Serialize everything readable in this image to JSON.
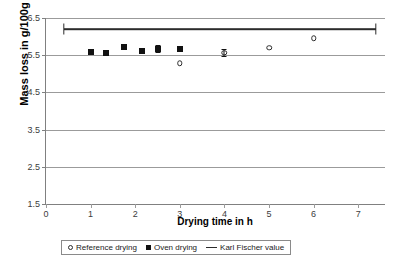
{
  "chart_data": {
    "type": "scatter",
    "title": "",
    "xlabel": "Drying time in h",
    "ylabel": "Mass loss in g/100g",
    "xlim": [
      0,
      7.6
    ],
    "ylim": [
      1.5,
      6.5
    ],
    "grid": true,
    "legend_position": "bottom",
    "x_ticks": [
      "0",
      "1",
      "2",
      "3",
      "4",
      "5",
      "6",
      "7"
    ],
    "x_tick_values": [
      0,
      1,
      2,
      3,
      4,
      5,
      6,
      7
    ],
    "y_ticks": [
      "1.5",
      "2.5",
      "3.5",
      "4.5",
      "5.5",
      "6.5"
    ],
    "y_tick_values": [
      1.5,
      2.5,
      3.5,
      4.5,
      5.5,
      6.5
    ],
    "series": [
      {
        "name": "Oven drying",
        "marker": "filled-square",
        "color": "#111111",
        "points": [
          {
            "x": 1.0,
            "y": 5.58,
            "yerr": 0.0
          },
          {
            "x": 1.35,
            "y": 5.55,
            "yerr": 0.0
          },
          {
            "x": 1.75,
            "y": 5.72,
            "yerr": 0.0
          },
          {
            "x": 2.15,
            "y": 5.6,
            "yerr": 0.0
          },
          {
            "x": 2.5,
            "y": 5.68,
            "yerr": 0.09
          },
          {
            "x": 3.0,
            "y": 5.68,
            "yerr": 0.0
          }
        ]
      },
      {
        "name": "Reference drying",
        "marker": "open-circle",
        "color": "#2b2b2b",
        "points": [
          {
            "x": 3.0,
            "y": 5.28,
            "yerr": 0.0
          },
          {
            "x": 4.0,
            "y": 5.57,
            "yerr": 0.1
          },
          {
            "x": 5.0,
            "y": 5.7,
            "yerr": 0.0
          },
          {
            "x": 6.0,
            "y": 5.95,
            "yerr": 0.0
          }
        ]
      },
      {
        "name": "Karl Fischer value",
        "marker": "line",
        "color": "#2b2b2b",
        "value": 6.2,
        "x_start": 0.4,
        "x_end": 7.4
      }
    ]
  },
  "legend": {
    "items": [
      {
        "label": "Reference drying",
        "key": "open-circle-icon"
      },
      {
        "label": "Oven drying",
        "key": "filled-square-icon"
      },
      {
        "label": "Karl Fischer value",
        "key": "line-icon"
      }
    ]
  }
}
